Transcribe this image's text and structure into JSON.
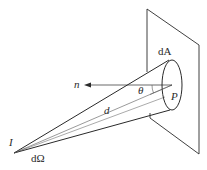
{
  "diagram": {
    "type": "geometry-illustration",
    "labels": {
      "source": "I",
      "solid_angle": "dΩ",
      "area": "dA",
      "normal": "n",
      "angle": "θ",
      "point": "P",
      "distance": "d"
    },
    "colors": {
      "line": "#2a2a2a",
      "background": "#ffffff"
    }
  }
}
